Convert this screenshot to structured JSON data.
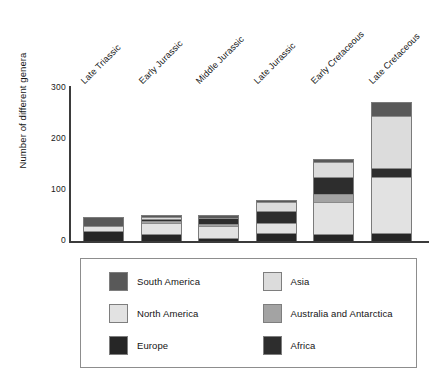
{
  "chart_data": {
    "type": "bar",
    "subtype": "stacked-bar",
    "title": "",
    "xlabel": "",
    "ylabel": "Number of different genera",
    "ylim": [
      0,
      300
    ],
    "yticks": [
      0,
      100,
      200,
      300
    ],
    "grid": false,
    "legend_position": "bottom",
    "categories": [
      "Late Triassic",
      "Early Jurassic",
      "Middle Jurassic",
      "Late Jurassic",
      "Early Cretaceous",
      "Late Cretaceous"
    ],
    "series": [
      {
        "name": "Europe",
        "color": "#262626",
        "values": [
          18,
          13,
          4,
          13,
          12,
          13
        ]
      },
      {
        "name": "Asia",
        "color": "#dcdcdc",
        "values": [
          0,
          0,
          0,
          0,
          0,
          0
        ]
      },
      {
        "name": "North America",
        "color": "#e2e2e2",
        "values": [
          10,
          21,
          25,
          21,
          62,
          110
        ]
      },
      {
        "name": "Australia and Antarctica",
        "color": "#a3a3a3",
        "values": [
          0,
          4,
          4,
          0,
          17,
          0
        ]
      },
      {
        "name": "Africa",
        "color": "#2d2d2d",
        "values": [
          0,
          4,
          12,
          23,
          32,
          18
        ]
      },
      {
        "name": "South America",
        "color": "#595959",
        "values": [
          18,
          5,
          6,
          4,
          6,
          28
        ]
      },
      {
        "name": "Asia (upper)",
        "color": "#dcdcdc",
        "values": [
          0,
          4,
          0,
          19,
          30,
          100
        ]
      }
    ],
    "totals": [
      46,
      51,
      51,
      80,
      159,
      269
    ],
    "stack_order_bottom_to_top": [
      "Europe",
      "North America",
      "Australia and Antarctica",
      "Africa",
      "Asia",
      "South America"
    ]
  },
  "legend": {
    "items": [
      {
        "label": "South America",
        "color": "#595959",
        "icon": "color-swatch"
      },
      {
        "label": "Asia",
        "color": "#dcdcdc",
        "icon": "color-swatch"
      },
      {
        "label": "North America",
        "color": "#e2e2e2",
        "icon": "color-swatch"
      },
      {
        "label": "Australia and Antarctica",
        "color": "#a3a3a3",
        "icon": "color-swatch"
      },
      {
        "label": "Europe",
        "color": "#262626",
        "icon": "color-swatch"
      },
      {
        "label": "Africa",
        "color": "#2d2d2d",
        "icon": "color-swatch"
      }
    ]
  },
  "axis": {
    "y_title": "Number of different genera",
    "y_tick_labels": [
      "300",
      "200",
      "100",
      "0"
    ]
  },
  "bars": [
    {
      "category": "Late Triassic",
      "total": 46,
      "segments": [
        {
          "series": "Europe",
          "value": 18,
          "color": "#262626"
        },
        {
          "series": "North America",
          "value": 10,
          "color": "#e2e2e2"
        },
        {
          "series": "South America",
          "value": 18,
          "color": "#595959"
        }
      ]
    },
    {
      "category": "Early Jurassic",
      "total": 51,
      "segments": [
        {
          "series": "Europe",
          "value": 13,
          "color": "#262626"
        },
        {
          "series": "North America",
          "value": 21,
          "color": "#e2e2e2"
        },
        {
          "series": "Australia and Antarctica",
          "value": 4,
          "color": "#a3a3a3"
        },
        {
          "series": "Africa",
          "value": 4,
          "color": "#2d2d2d"
        },
        {
          "series": "Asia",
          "value": 4,
          "color": "#dcdcdc"
        },
        {
          "series": "South America",
          "value": 5,
          "color": "#595959"
        }
      ]
    },
    {
      "category": "Middle Jurassic",
      "total": 51,
      "segments": [
        {
          "series": "Europe",
          "value": 4,
          "color": "#262626"
        },
        {
          "series": "North America",
          "value": 25,
          "color": "#e2e2e2"
        },
        {
          "series": "Australia and Antarctica",
          "value": 4,
          "color": "#a3a3a3"
        },
        {
          "series": "Africa",
          "value": 12,
          "color": "#2d2d2d"
        },
        {
          "series": "South America",
          "value": 6,
          "color": "#595959"
        }
      ]
    },
    {
      "category": "Late Jurassic",
      "total": 80,
      "segments": [
        {
          "series": "Europe",
          "value": 13,
          "color": "#262626"
        },
        {
          "series": "North America",
          "value": 21,
          "color": "#e2e2e2"
        },
        {
          "series": "Africa",
          "value": 23,
          "color": "#2d2d2d"
        },
        {
          "series": "Asia",
          "value": 19,
          "color": "#dcdcdc"
        },
        {
          "series": "South America",
          "value": 4,
          "color": "#595959"
        }
      ]
    },
    {
      "category": "Early Cretaceous",
      "total": 159,
      "segments": [
        {
          "series": "Europe",
          "value": 12,
          "color": "#262626"
        },
        {
          "series": "North America",
          "value": 62,
          "color": "#e2e2e2"
        },
        {
          "series": "Australia and Antarctica",
          "value": 17,
          "color": "#a3a3a3"
        },
        {
          "series": "Africa",
          "value": 32,
          "color": "#2d2d2d"
        },
        {
          "series": "Asia",
          "value": 30,
          "color": "#dcdcdc"
        },
        {
          "series": "South America",
          "value": 6,
          "color": "#595959"
        }
      ]
    },
    {
      "category": "Late Cretaceous",
      "total": 269,
      "segments": [
        {
          "series": "Europe",
          "value": 13,
          "color": "#262626"
        },
        {
          "series": "North America",
          "value": 110,
          "color": "#e2e2e2"
        },
        {
          "series": "Africa",
          "value": 18,
          "color": "#2d2d2d"
        },
        {
          "series": "Asia",
          "value": 100,
          "color": "#dcdcdc"
        },
        {
          "series": "South America",
          "value": 28,
          "color": "#595959"
        }
      ]
    }
  ]
}
